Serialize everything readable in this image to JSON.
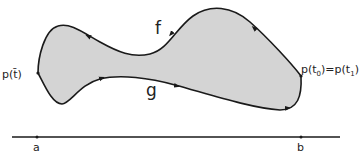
{
  "diagram": {
    "colors": {
      "region_fill": "#d4d4d4",
      "stroke": "#1a1a1a",
      "background": "#ffffff"
    },
    "curves": {
      "upper": {
        "label": "f",
        "direction": "right-to-left"
      },
      "lower": {
        "label": "g",
        "direction": "left-to-right"
      }
    },
    "points": {
      "left": {
        "label": "p(t̄)",
        "label_base": "p(t",
        "label_bar": "t̄"
      },
      "right": {
        "label": "p(t0)=p(t1)",
        "part1": "p(t",
        "sub0": "0",
        "mid": ")=p(t",
        "sub1": "1",
        "close": ")"
      }
    },
    "interval": {
      "start_label": "a",
      "end_label": "b"
    }
  }
}
